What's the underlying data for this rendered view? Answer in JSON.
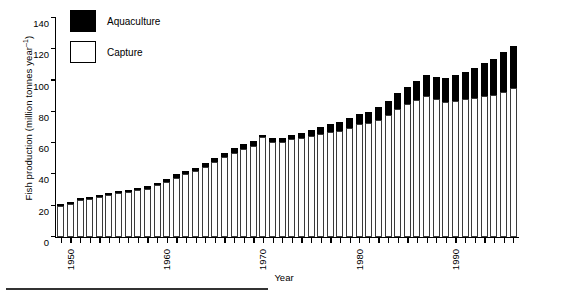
{
  "chart_data": {
    "type": "bar",
    "stacked": true,
    "title": "",
    "xlabel": "Year",
    "ylabel": "Fish production (million tonnes year⁻¹)",
    "ylabel_text": "Fish production (million tonnes year",
    "ylabel_exp": "–1",
    "ylabel_tail": ")",
    "ylim": [
      0,
      140
    ],
    "ytick_values": [
      0,
      20,
      40,
      60,
      80,
      100,
      120,
      140
    ],
    "ytick_labels": [
      "0",
      "20",
      "40",
      "60",
      "80",
      "100",
      "120",
      "140"
    ],
    "xlim": [
      1949.5,
      1997.5
    ],
    "xtick_labels": [
      "1950",
      "1960",
      "1970",
      "1980",
      "1990"
    ],
    "xtick_label_years": [
      1950,
      1960,
      1970,
      1980,
      1990
    ],
    "grid": false,
    "legend_position": "upper-left",
    "series": [
      {
        "name": "Capture",
        "color": "#ffffff",
        "values": [
          20,
          21,
          23.5,
          24.5,
          25.5,
          27,
          28,
          29,
          30,
          31,
          33,
          35,
          38,
          40,
          42,
          45,
          48,
          51,
          54,
          56,
          58,
          64,
          61,
          60.5,
          62.5,
          63,
          64.5,
          66,
          67,
          68,
          70,
          72,
          73,
          75,
          78,
          82,
          85,
          87.5,
          90,
          88,
          86,
          87,
          88,
          89,
          90,
          91,
          93,
          95
        ],
        "last_value": 95
      },
      {
        "name": "Aquaculture",
        "color": "#000000",
        "values": [
          0.5,
          0.6,
          0.7,
          0.8,
          0.9,
          1,
          1.1,
          1.2,
          1.3,
          1.4,
          1.6,
          1.8,
          2,
          2.2,
          2.4,
          2.6,
          2.8,
          3,
          3.2,
          3.4,
          3.6,
          1.5,
          2,
          2.5,
          3,
          3.5,
          4,
          4.5,
          5,
          5.5,
          6,
          6.5,
          7,
          8,
          9,
          10,
          11,
          12.5,
          13.5,
          14.5,
          15.5,
          16.5,
          17.5,
          19,
          21,
          23,
          25,
          27
        ],
        "last_value": 27
      }
    ],
    "categories": [
      1950,
      1951,
      1952,
      1953,
      1954,
      1955,
      1956,
      1957,
      1958,
      1959,
      1960,
      1961,
      1962,
      1963,
      1964,
      1965,
      1966,
      1967,
      1968,
      1969,
      1970,
      1971,
      1972,
      1973,
      1974,
      1975,
      1976,
      1977,
      1978,
      1979,
      1980,
      1981,
      1982,
      1983,
      1984,
      1985,
      1986,
      1987,
      1988,
      1989,
      1990,
      1991,
      1992,
      1993,
      1994,
      1995,
      1996,
      1997
    ],
    "totals": [
      20.5,
      21.6,
      24.2,
      25.3,
      26.4,
      28,
      29.1,
      30.2,
      31.3,
      32.4,
      34.6,
      36.8,
      40,
      42.2,
      44.4,
      47.6,
      50.8,
      54,
      57.2,
      59.4,
      61.6,
      65.5,
      63,
      63,
      65.5,
      66.5,
      68.5,
      70.5,
      72,
      73.5,
      76,
      78.5,
      80,
      83,
      87,
      92,
      96,
      100,
      103.5,
      102.5,
      101.5,
      103.5,
      105.5,
      108,
      111,
      114,
      118,
      122
    ]
  },
  "legend": {
    "items": [
      {
        "label": "Aquaculture",
        "swatch": "black"
      },
      {
        "label": "Capture",
        "swatch": "white"
      }
    ]
  }
}
